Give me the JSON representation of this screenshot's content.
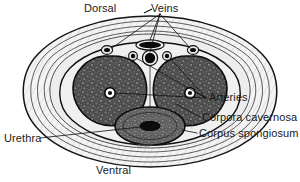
{
  "figure": {
    "title_alt": "Cross section of the penis",
    "signature": "Deluca",
    "colors": {
      "ink": "#1a1a1a",
      "corpora_fill": "#5a5a5a",
      "spongiosum_fill": "#6a6a6a",
      "sheath_fill": "#f2f2f2",
      "inner_fill": "#ededed",
      "vessel_lumen": "#111111",
      "page_bg": "#ffffff"
    }
  },
  "labels": {
    "dorsal": "Dorsal",
    "veins": "Veins",
    "arteries": "Arteries",
    "corpora_cavernosa": "Corpora cavernosa",
    "corpus_spongiosum": "Corpus spongiosum",
    "urethra": "Urethra",
    "ventral": "Ventral"
  },
  "structures": [
    {
      "name": "deep-dorsal-vein",
      "label": "Veins"
    },
    {
      "name": "circumflex-vein-left",
      "label": "Veins"
    },
    {
      "name": "circumflex-vein-right",
      "label": "Veins"
    },
    {
      "name": "dorsal-artery-left",
      "label": "Arteries"
    },
    {
      "name": "dorsal-artery-right",
      "label": "Arteries"
    },
    {
      "name": "cavernosal-artery-left",
      "label": "Arteries"
    },
    {
      "name": "cavernosal-artery-right",
      "label": "Arteries"
    },
    {
      "name": "corpus-cavernosum-left",
      "label": "Corpora cavernosa"
    },
    {
      "name": "corpus-cavernosum-right",
      "label": "Corpora cavernosa"
    },
    {
      "name": "corpus-spongiosum",
      "label": "Corpus spongiosum"
    },
    {
      "name": "urethra",
      "label": "Urethra"
    }
  ]
}
